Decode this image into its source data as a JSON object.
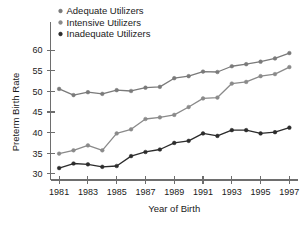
{
  "chart_data": {
    "type": "line",
    "title": "",
    "xlabel": "Year of Birth",
    "ylabel": "Preterm Birth Rate",
    "x": [
      1981,
      1982,
      1983,
      1984,
      1985,
      1986,
      1987,
      1988,
      1989,
      1990,
      1991,
      1992,
      1993,
      1994,
      1995,
      1996,
      1997
    ],
    "xlim": [
      1980.4,
      1997.6
    ],
    "ylim": [
      28.5,
      61.5
    ],
    "xticks": [
      1981,
      1983,
      1985,
      1987,
      1989,
      1991,
      1993,
      1995,
      1997
    ],
    "xtick_labels": [
      "1981",
      "1983",
      "1985",
      "1987",
      "1989",
      "1991",
      "1993",
      "1995",
      "1997"
    ],
    "yticks": [
      30,
      35,
      40,
      45,
      50,
      55,
      60
    ],
    "ytick_labels": [
      "30",
      "35",
      "40",
      "45",
      "50",
      "55",
      "60"
    ],
    "grid": false,
    "legend_position": "top-left",
    "series": [
      {
        "name": "Adequate Utilizers",
        "color": "#7a7a7a",
        "marker": "circle",
        "values": [
          50.6,
          49.1,
          49.8,
          49.4,
          50.3,
          50.1,
          50.9,
          51.1,
          53.2,
          53.7,
          54.8,
          54.7,
          56.1,
          56.6,
          57.2,
          58.0,
          59.3
        ]
      },
      {
        "name": "Intensive Utilizers",
        "color": "#8a8a8a",
        "marker": "circle",
        "values": [
          34.9,
          35.7,
          36.9,
          35.7,
          39.8,
          40.8,
          43.3,
          43.7,
          44.3,
          46.2,
          48.3,
          48.5,
          51.9,
          52.3,
          53.7,
          54.2,
          55.9
        ]
      },
      {
        "name": "Inadequate Utilizers",
        "color": "#2c2c2c",
        "marker": "circle",
        "values": [
          31.4,
          32.5,
          32.3,
          31.7,
          31.9,
          34.3,
          35.3,
          35.9,
          37.5,
          38.0,
          39.8,
          39.2,
          40.6,
          40.6,
          39.8,
          40.1,
          41.2
        ]
      }
    ]
  },
  "legend": {
    "items": [
      {
        "label": "Adequate Utilizers",
        "color": "#7a7a7a"
      },
      {
        "label": "Intensive Utilizers",
        "color": "#8a8a8a"
      },
      {
        "label": "Inadequate Utilizers",
        "color": "#2c2c2c"
      }
    ]
  },
  "axes": {
    "x_title": "Year of Birth",
    "y_title": "Preterm Birth Rate"
  }
}
